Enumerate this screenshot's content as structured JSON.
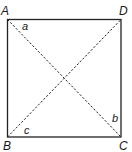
{
  "diagram": {
    "type": "geometry-square-with-diagonals",
    "vertices": [
      {
        "name": "A",
        "x": 7.5,
        "y": 19.5
      },
      {
        "name": "D",
        "x": 121,
        "y": 19.5
      },
      {
        "name": "C",
        "x": 121,
        "y": 137
      },
      {
        "name": "B",
        "x": 7.5,
        "y": 137
      }
    ],
    "vertex_labels": {
      "A": "A",
      "B": "B",
      "C": "C",
      "D": "D"
    },
    "angle_labels": {
      "a": "a",
      "b": "b",
      "c": "c"
    },
    "diagonals": [
      "AC",
      "BD"
    ],
    "colors": {
      "stroke": "#222222",
      "text": "#1a1a1a"
    }
  }
}
